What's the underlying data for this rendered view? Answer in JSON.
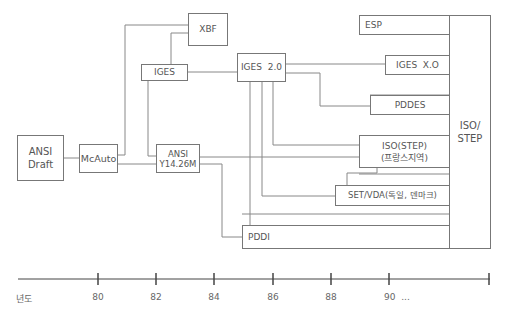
{
  "diagram": {
    "nodes": {
      "ansi_draft": {
        "line1": "ANSI",
        "line2": "Draft"
      },
      "mcauto": {
        "label": "McAuto"
      },
      "xbf": {
        "label": "XBF"
      },
      "iges": {
        "label": "IGES"
      },
      "ansi_y14": {
        "line1": "ANSI",
        "line2": "Y14.26M"
      },
      "iges_20": {
        "label": "IGES  2.0"
      },
      "esp": {
        "label": "ESP"
      },
      "iges_xo": {
        "label": "IGES  X.O"
      },
      "pddes": {
        "label": "PDDES"
      },
      "iso_step_fr": {
        "line1": "ISO(STEP)",
        "line2": "(프랑스지역)"
      },
      "set_vda": {
        "label": "SET/VDA(독일, 덴마크)"
      },
      "pddi": {
        "label": "PDDI"
      },
      "iso_step": {
        "line1": "ISO/",
        "line2": "STEP"
      }
    },
    "edges": [
      [
        "ansi_draft",
        "mcauto"
      ],
      [
        "mcauto",
        "xbf"
      ],
      [
        "mcauto",
        "ansi_y14"
      ],
      [
        "xbf",
        "iges"
      ],
      [
        "iges",
        "iges_20"
      ],
      [
        "iges",
        "ansi_y14"
      ],
      [
        "ansi_y14",
        "iso_step"
      ],
      [
        "ansi_y14",
        "pddi"
      ],
      [
        "iges_20",
        "iges_xo"
      ],
      [
        "iges_20",
        "pddes"
      ],
      [
        "iges_20",
        "iso_step_fr"
      ],
      [
        "iges_20",
        "set_vda"
      ],
      [
        "iges_20",
        "pddi"
      ],
      [
        "iso_step_fr",
        "set_vda"
      ],
      [
        "esp",
        "iso_step"
      ],
      [
        "iges_xo",
        "iso_step"
      ],
      [
        "pddes",
        "iso_step"
      ],
      [
        "iso_step_fr",
        "iso_step"
      ],
      [
        "set_vda",
        "iso_step"
      ],
      [
        "pddi",
        "iso_step"
      ]
    ]
  },
  "timeline": {
    "axis_label": "년도",
    "ticks": [
      {
        "label": "80",
        "x": 98
      },
      {
        "label": "82",
        "x": 156
      },
      {
        "label": "84",
        "x": 214
      },
      {
        "label": "86",
        "x": 273
      },
      {
        "label": "88",
        "x": 331
      },
      {
        "label": "90  ...",
        "x": 389
      }
    ]
  },
  "colors": {
    "line": "#777777",
    "text": "#555555",
    "axis": "#444444"
  }
}
